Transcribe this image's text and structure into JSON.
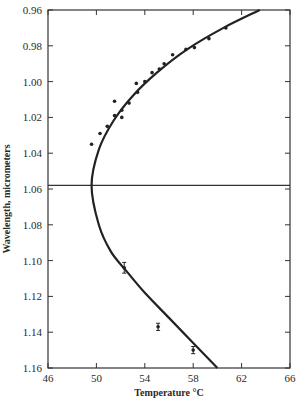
{
  "chart_data": {
    "type": "scatter",
    "title": "",
    "xlabel": "Temperature °C",
    "ylabel": "Wavelength, micrometers",
    "xlim": [
      46,
      66
    ],
    "ylim": [
      1.16,
      0.96
    ],
    "y_inverted": true,
    "grid": false,
    "legend": null,
    "x_ticks": [
      "46",
      "50",
      "54",
      "58",
      "62",
      "66"
    ],
    "y_ticks": [
      "0.96",
      "0.98",
      "1.00",
      "1.02",
      "1.04",
      "1.06",
      "1.08",
      "1.10",
      "1.12",
      "1.14",
      "1.16"
    ],
    "horizontal_line": {
      "y": 1.058
    },
    "series": [
      {
        "name": "measured points",
        "style": "dot",
        "points": [
          {
            "x": 49.6,
            "y": 1.035
          },
          {
            "x": 50.3,
            "y": 1.029
          },
          {
            "x": 50.9,
            "y": 1.025
          },
          {
            "x": 51.5,
            "y": 1.011
          },
          {
            "x": 51.5,
            "y": 1.019
          },
          {
            "x": 52.1,
            "y": 1.016
          },
          {
            "x": 52.1,
            "y": 1.02
          },
          {
            "x": 52.7,
            "y": 1.012
          },
          {
            "x": 53.3,
            "y": 1.001
          },
          {
            "x": 53.4,
            "y": 1.006
          },
          {
            "x": 54.0,
            "y": 1.0
          },
          {
            "x": 54.6,
            "y": 0.995
          },
          {
            "x": 55.2,
            "y": 0.993
          },
          {
            "x": 55.6,
            "y": 0.99
          },
          {
            "x": 56.3,
            "y": 0.985
          },
          {
            "x": 57.4,
            "y": 0.982
          },
          {
            "x": 58.1,
            "y": 0.981
          },
          {
            "x": 59.3,
            "y": 0.976
          },
          {
            "x": 60.7,
            "y": 0.97
          }
        ]
      },
      {
        "name": "points with error bars",
        "style": "dot-errorbar",
        "points": [
          {
            "x": 52.3,
            "y": 1.104,
            "err": 0.003
          },
          {
            "x": 55.1,
            "y": 1.137,
            "err": 0.002
          },
          {
            "x": 58.0,
            "y": 1.15,
            "err": 0.002
          }
        ]
      },
      {
        "name": "fitted curve",
        "style": "line",
        "points": [
          {
            "x": 63.5,
            "y": 0.96
          },
          {
            "x": 60.5,
            "y": 0.97
          },
          {
            "x": 57.5,
            "y": 0.982
          },
          {
            "x": 55.0,
            "y": 0.995
          },
          {
            "x": 53.0,
            "y": 1.008
          },
          {
            "x": 51.4,
            "y": 1.022
          },
          {
            "x": 50.2,
            "y": 1.038
          },
          {
            "x": 49.6,
            "y": 1.058
          },
          {
            "x": 50.2,
            "y": 1.08
          },
          {
            "x": 51.2,
            "y": 1.095
          },
          {
            "x": 52.5,
            "y": 1.106
          },
          {
            "x": 54.0,
            "y": 1.118
          },
          {
            "x": 56.0,
            "y": 1.132
          },
          {
            "x": 58.0,
            "y": 1.146
          },
          {
            "x": 60.0,
            "y": 1.16
          }
        ]
      }
    ]
  }
}
